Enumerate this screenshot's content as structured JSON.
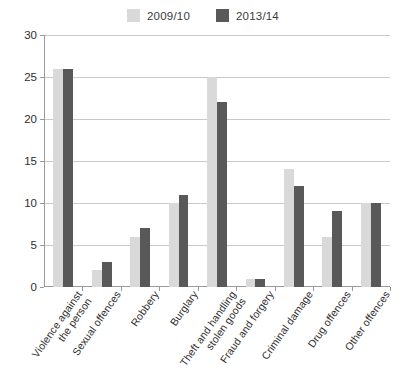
{
  "chart_data": {
    "type": "bar",
    "title": "",
    "subtitle": "",
    "xlabel": "",
    "ylabel": "",
    "ylim": [
      0,
      30
    ],
    "yticks": [
      0,
      5,
      10,
      15,
      20,
      25,
      30
    ],
    "grid": true,
    "legend_position": "top-center",
    "categories": [
      "Violence against the person",
      "Sexual offences",
      "Robbery",
      "Burglary",
      "Theft and handling stolen goods",
      "Fraud and forgery",
      "Criminal damage",
      "Drug offences",
      "Other offences"
    ],
    "category_lines": [
      [
        "Violence against",
        "the person"
      ],
      [
        "Sexual offences"
      ],
      [
        "Robbery"
      ],
      [
        "Burglary"
      ],
      [
        "Theft and handling",
        "stolen goods"
      ],
      [
        "Fraud and forgery"
      ],
      [
        "Criminal damage"
      ],
      [
        "Drug offences"
      ],
      [
        "Other offences"
      ]
    ],
    "series": [
      {
        "name": "2009/10",
        "color": "#d9d9d9",
        "values": [
          26,
          2,
          6,
          10,
          25,
          1,
          14,
          6,
          10
        ]
      },
      {
        "name": "2013/14",
        "color": "#595959",
        "values": [
          26,
          3,
          7,
          11,
          22,
          1,
          12,
          9,
          10
        ]
      }
    ]
  },
  "legend": {
    "entries": [
      {
        "label": "2009/10",
        "color": "#d9d9d9"
      },
      {
        "label": "2013/14",
        "color": "#595959"
      }
    ]
  },
  "axis": {
    "y_tick_labels": [
      "0",
      "5",
      "10",
      "15",
      "20",
      "25",
      "30"
    ]
  },
  "colors": {
    "series_2009_10": "#d9d9d9",
    "series_2013_14": "#595959",
    "gridline": "#c9c9c9",
    "axis": "#9a9a9a",
    "text": "#2e2e2e",
    "background": "#ffffff"
  }
}
